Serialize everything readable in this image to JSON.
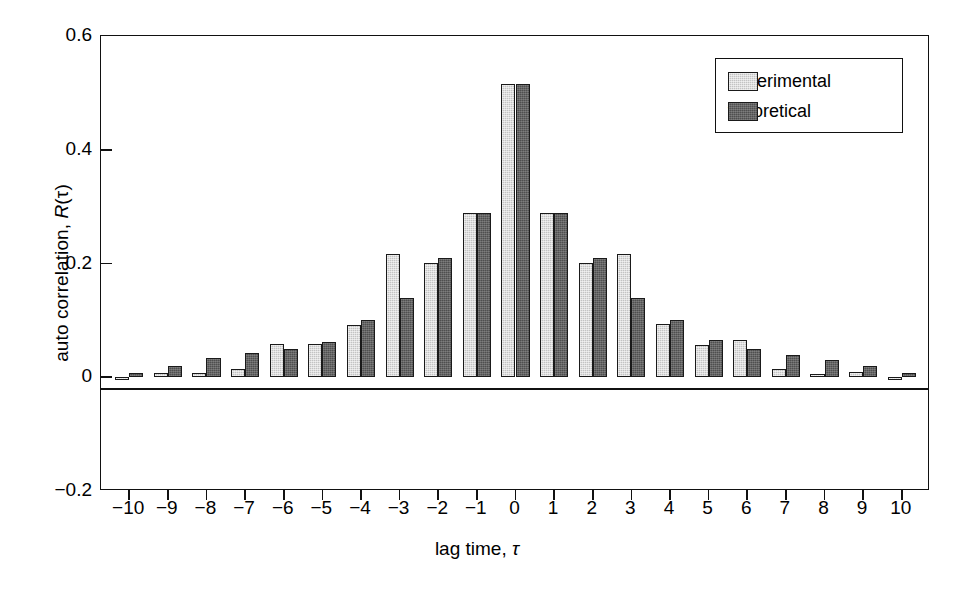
{
  "chart_data": {
    "type": "bar",
    "title": "",
    "xlabel": "lag time, τ",
    "ylabel": "auto correlation, R(τ)",
    "xlabel_parts": {
      "text": "lag time, ",
      "symbol": "τ"
    },
    "ylabel_parts": {
      "text": "auto correlation, ",
      "italic": "R",
      "symbol": "(τ)"
    },
    "categories": [
      "-10",
      "-9",
      "-8",
      "-7",
      "-6",
      "-5",
      "-4",
      "-3",
      "-2",
      "-1",
      "0",
      "1",
      "2",
      "3",
      "4",
      "5",
      "6",
      "7",
      "8",
      "9",
      "10"
    ],
    "x": [
      -10,
      -9,
      -8,
      -7,
      -6,
      -5,
      -4,
      -3,
      -2,
      -1,
      0,
      1,
      2,
      3,
      4,
      5,
      6,
      7,
      8,
      9,
      10
    ],
    "series": [
      {
        "name": "experimental",
        "color": "#c3c3c3",
        "values": [
          -0.005,
          0.008,
          0.007,
          0.015,
          0.058,
          0.058,
          0.092,
          0.217,
          0.201,
          0.289,
          0.515,
          0.288,
          0.201,
          0.216,
          0.093,
          0.056,
          0.066,
          0.014,
          0.005,
          0.009,
          -0.004
        ]
      },
      {
        "name": "theoretical",
        "color": "#4f4f4f",
        "values": [
          0.007,
          0.02,
          0.033,
          0.042,
          0.05,
          0.062,
          0.1,
          0.139,
          0.209,
          0.288,
          0.515,
          0.288,
          0.209,
          0.139,
          0.1,
          0.066,
          0.05,
          0.04,
          0.031,
          0.02,
          0.007
        ]
      }
    ],
    "ylim": [
      -0.2,
      0.6
    ],
    "xlim": [
      -10.5,
      10.5
    ],
    "yticks": [
      0.6,
      0.4,
      0.2,
      0,
      -0.2
    ],
    "ytick_labels": [
      "0.6",
      "0.4",
      "0.2",
      "0",
      "-0.2"
    ],
    "grid": false,
    "legend_position": "top-right",
    "legend_entries": [
      "experimental",
      "theoretical"
    ]
  }
}
